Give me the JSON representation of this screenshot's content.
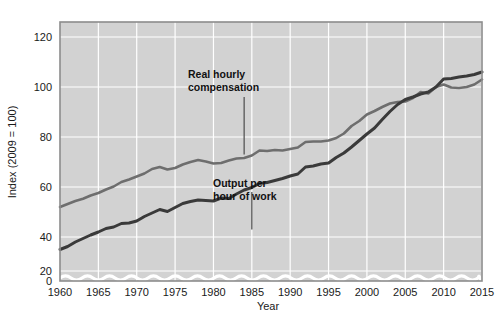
{
  "chart_data": {
    "type": "line",
    "title": "",
    "subtitle": "",
    "xlabel": "Year",
    "ylabel": "Index (2009 = 100)",
    "xlim": [
      1960,
      2015
    ],
    "ylim": [
      0,
      126
    ],
    "y_display_min": 28,
    "grid": true,
    "grid_color": "#ffffff",
    "plot_background": "#d2d2d2",
    "legend_position": "inline-annotations",
    "axis_break": {
      "present": true,
      "style": "wavy-white-line",
      "value": 6
    },
    "yticks": [
      0,
      20,
      40,
      60,
      80,
      100,
      120
    ],
    "ytick_labels": [
      "0",
      "20",
      "40",
      "60",
      "80",
      "100",
      "120"
    ],
    "xticks": [
      1960,
      1965,
      1970,
      1975,
      1980,
      1985,
      1990,
      1995,
      2000,
      2005,
      2010,
      2015
    ],
    "xtick_labels": [
      "1960",
      "1965",
      "1970",
      "1975",
      "1980",
      "1985",
      "1990",
      "1995",
      "2000",
      "2005",
      "2010",
      "2015"
    ],
    "series": [
      {
        "name": "Real hourly compensation",
        "color": "#6e6e6e",
        "width": 2.6,
        "x": [
          1960,
          1961,
          1962,
          1963,
          1964,
          1965,
          1966,
          1967,
          1968,
          1969,
          1970,
          1971,
          1972,
          1973,
          1974,
          1975,
          1976,
          1977,
          1978,
          1979,
          1980,
          1981,
          1982,
          1983,
          1984,
          1985,
          1986,
          1987,
          1988,
          1989,
          1990,
          1991,
          1992,
          1993,
          1994,
          1995,
          1996,
          1997,
          1998,
          1999,
          2000,
          2001,
          2002,
          2003,
          2004,
          2005,
          2006,
          2007,
          2008,
          2009,
          2010,
          2011,
          2012,
          2013,
          2014,
          2015
        ],
        "values": [
          52.0,
          53.2,
          54.4,
          55.3,
          56.6,
          57.6,
          59.0,
          60.2,
          62.0,
          63.0,
          64.2,
          65.4,
          67.2,
          68.0,
          67.0,
          67.6,
          69.0,
          70.0,
          70.8,
          70.2,
          69.4,
          69.6,
          70.6,
          71.4,
          71.6,
          72.6,
          74.6,
          74.4,
          74.8,
          74.6,
          75.2,
          75.8,
          78.0,
          78.2,
          78.2,
          78.6,
          79.6,
          81.4,
          84.4,
          86.4,
          89.0,
          90.4,
          92.0,
          93.4,
          94.0,
          94.2,
          95.6,
          98.0,
          97.4,
          100.0,
          101.0,
          99.8,
          99.6,
          100.0,
          101.0,
          103.0
        ]
      },
      {
        "name": "Output per hour of work",
        "color": "#3a3a3a",
        "width": 3.0,
        "x": [
          1960,
          1961,
          1962,
          1963,
          1964,
          1965,
          1966,
          1967,
          1968,
          1969,
          1970,
          1971,
          1972,
          1973,
          1974,
          1975,
          1976,
          1977,
          1978,
          1979,
          1980,
          1981,
          1982,
          1983,
          1984,
          1985,
          1986,
          1987,
          1988,
          1989,
          1990,
          1991,
          1992,
          1993,
          1994,
          1995,
          1996,
          1997,
          1998,
          1999,
          2000,
          2001,
          2002,
          2003,
          2004,
          2005,
          2006,
          2007,
          2008,
          2009,
          2010,
          2011,
          2012,
          2013,
          2014,
          2015
        ],
        "values": [
          35.0,
          36.2,
          38.0,
          39.4,
          40.8,
          42.0,
          43.4,
          44.0,
          45.4,
          45.6,
          46.4,
          48.2,
          49.6,
          51.0,
          50.2,
          51.8,
          53.4,
          54.2,
          54.8,
          54.6,
          54.4,
          55.6,
          55.4,
          57.2,
          58.8,
          59.8,
          61.4,
          61.8,
          62.6,
          63.4,
          64.4,
          65.2,
          68.0,
          68.4,
          69.2,
          69.6,
          71.8,
          73.6,
          76.0,
          78.6,
          81.2,
          83.6,
          87.0,
          90.2,
          93.0,
          95.0,
          96.0,
          97.2,
          98.0,
          100.0,
          103.2,
          103.4,
          104.0,
          104.4,
          105.0,
          106.0
        ]
      }
    ],
    "annotations": [
      {
        "id": "compensation-annotation",
        "lines": [
          "Real hourly",
          "compensation"
        ],
        "pointer_x": 1984,
        "pointer_from_y": 96,
        "pointer_to_y": 73
      },
      {
        "id": "output-annotation",
        "lines": [
          "Output per",
          "hour of work"
        ],
        "pointer_x": 1985,
        "pointer_from_y": 43,
        "pointer_to_y": 58
      }
    ]
  }
}
